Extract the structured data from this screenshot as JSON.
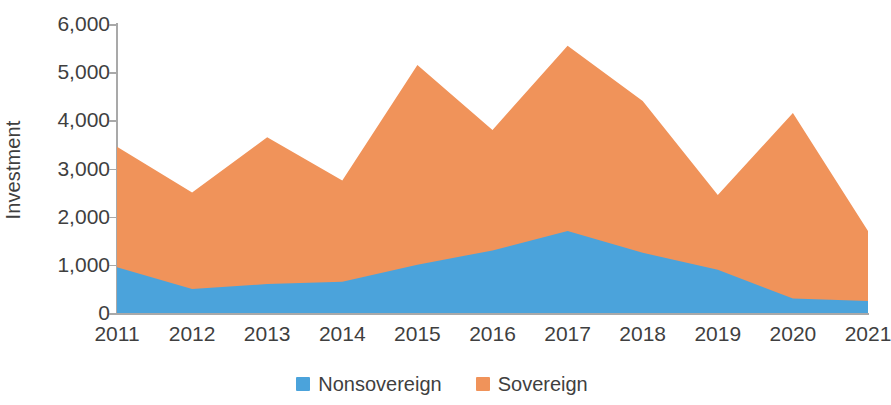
{
  "chart_data": {
    "type": "area",
    "stacked": true,
    "title": "",
    "subtitle": "",
    "xlabel": "",
    "ylabel": "Investment",
    "categories": [
      "2011",
      "2012",
      "2013",
      "2014",
      "2015",
      "2016",
      "2017",
      "2018",
      "2019",
      "2020",
      "2021"
    ],
    "x": [
      2011,
      2012,
      2013,
      2014,
      2015,
      2016,
      2017,
      2018,
      2019,
      2020,
      2021
    ],
    "series": [
      {
        "name": "Nonsovereign",
        "color": "#4BA3DB",
        "values": [
          950,
          500,
          600,
          650,
          1000,
          1300,
          1700,
          1250,
          900,
          300,
          250
        ]
      },
      {
        "name": "Sovereign",
        "color": "#F0935A",
        "values": [
          2500,
          2000,
          3050,
          2100,
          4150,
          2500,
          3850,
          3150,
          1550,
          3850,
          1450
        ]
      }
    ],
    "totals": [
      3450,
      2500,
      3650,
      2750,
      5150,
      3800,
      5550,
      4400,
      2450,
      4150,
      1700
    ],
    "ylim": [
      0,
      6000
    ],
    "yticks": [
      0,
      1000,
      2000,
      3000,
      4000,
      5000,
      6000
    ],
    "ytick_labels": [
      "0",
      "1,000",
      "2,000",
      "3,000",
      "4,000",
      "5,000",
      "6,000"
    ],
    "grid": false,
    "legend_position": "bottom"
  },
  "axes": {
    "y_title": "Investment",
    "y_tick_labels": [
      "6,000",
      "5,000",
      "4,000",
      "3,000",
      "2,000",
      "1,000",
      "0"
    ],
    "x_tick_labels": [
      "2011",
      "2012",
      "2013",
      "2014",
      "2015",
      "2016",
      "2017",
      "2018",
      "2019",
      "2020",
      "2021"
    ]
  },
  "legend": {
    "items": [
      {
        "label": "Nonsovereign",
        "color": "#4BA3DB"
      },
      {
        "label": "Sovereign",
        "color": "#F0935A"
      }
    ]
  },
  "colors": {
    "nonsovereign": "#4BA3DB",
    "sovereign": "#F0935A",
    "axis": "#a9a9a9",
    "text": "#3f3f3f",
    "background": "#ffffff"
  }
}
